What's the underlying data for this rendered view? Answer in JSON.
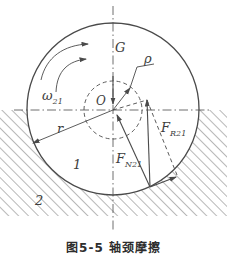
{
  "figure": {
    "caption": "图5-5 轴颈摩擦",
    "parts": {
      "journal": "1",
      "bearing": "2"
    },
    "labels": {
      "load": "G",
      "rho": "ρ",
      "omega": "ω",
      "omega_sub": "21",
      "center": "O",
      "radius": "r",
      "normal_force": "F",
      "normal_force_sub": "N21",
      "total_reaction": "F",
      "total_reaction_sub": "R21"
    },
    "colors": {
      "line": "#4a4a4a",
      "hatch": "#9a9a9a",
      "background": "#ffffff"
    }
  }
}
